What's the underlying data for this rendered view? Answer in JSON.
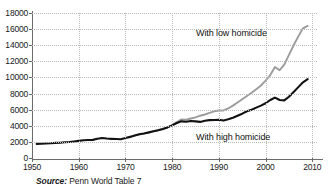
{
  "figure": {
    "source_prefix": "Source:",
    "source_text": "Penn World Table 7",
    "clipped_top_text": ""
  },
  "chart_data": {
    "type": "line",
    "title": "",
    "subtitle": "",
    "xlabel": "",
    "ylabel": "",
    "xlim": [
      1950,
      2011
    ],
    "ylim": [
      0,
      18000
    ],
    "grid": true,
    "legend_position": "inline-annotation",
    "yticks": [
      0,
      2000,
      4000,
      6000,
      8000,
      10000,
      12000,
      14000,
      16000,
      18000
    ],
    "ytick_labels": [
      "0",
      "2000",
      "4000",
      "6000",
      "8000",
      "10000",
      "12000",
      "14000",
      "16000",
      "18000"
    ],
    "xticks": [
      1950,
      1960,
      1970,
      1980,
      1990,
      2000,
      2010
    ],
    "xtick_labels": [
      "1950",
      "1960",
      "1970",
      "1980",
      "1990",
      "2000",
      "2010"
    ],
    "annotations": [
      {
        "text": "With low homicide",
        "x": 1991,
        "y": 14800
      },
      {
        "text": "With high homicide",
        "x": 1991,
        "y": 3000
      }
    ],
    "series": [
      {
        "name": "With low homicide",
        "color": "#9c9c9c",
        "x": [
          1971,
          1972,
          1973,
          1974,
          1975,
          1976,
          1977,
          1978,
          1979,
          1980,
          1981,
          1982,
          1983,
          1984,
          1985,
          1986,
          1987,
          1988,
          1989,
          1990,
          1991,
          1992,
          1993,
          1994,
          1995,
          1996,
          1997,
          1998,
          1999,
          2000,
          2001,
          2002,
          2003,
          2004,
          2005,
          2006,
          2007,
          2008,
          2009
        ],
        "values": [
          2650,
          2800,
          2950,
          3050,
          3150,
          3300,
          3450,
          3600,
          3800,
          4100,
          4450,
          4800,
          4750,
          4900,
          5050,
          5250,
          5400,
          5600,
          5800,
          5900,
          5900,
          6150,
          6500,
          6900,
          7300,
          7700,
          8100,
          8550,
          9000,
          9600,
          10300,
          11300,
          10900,
          11600,
          12800,
          14000,
          15100,
          16100,
          16400
        ]
      },
      {
        "name": "With high homicide",
        "color": "#121212",
        "x": [
          1951,
          1952,
          1953,
          1954,
          1955,
          1956,
          1957,
          1958,
          1959,
          1960,
          1961,
          1962,
          1963,
          1964,
          1965,
          1966,
          1967,
          1968,
          1969,
          1970,
          1971,
          1972,
          1973,
          1974,
          1975,
          1976,
          1977,
          1978,
          1979,
          1980,
          1981,
          1982,
          1983,
          1984,
          1985,
          1986,
          1987,
          1988,
          1989,
          1990,
          1991,
          1992,
          1993,
          1994,
          1995,
          1996,
          1997,
          1998,
          1999,
          2000,
          2001,
          2002,
          2003,
          2004,
          2005,
          2006,
          2007,
          2008,
          2009
        ],
        "values": [
          1750,
          1760,
          1800,
          1830,
          1880,
          1900,
          1950,
          1980,
          2050,
          2130,
          2200,
          2230,
          2250,
          2400,
          2480,
          2420,
          2380,
          2350,
          2330,
          2480,
          2620,
          2780,
          2950,
          3050,
          3180,
          3320,
          3450,
          3600,
          3800,
          4050,
          4350,
          4550,
          4500,
          4600,
          4550,
          4480,
          4620,
          4700,
          4720,
          4750,
          4650,
          4800,
          5000,
          5250,
          5500,
          5800,
          6000,
          6250,
          6500,
          6800,
          7200,
          7500,
          7200,
          7150,
          7600,
          8200,
          8800,
          9400,
          9800
        ]
      }
    ]
  }
}
